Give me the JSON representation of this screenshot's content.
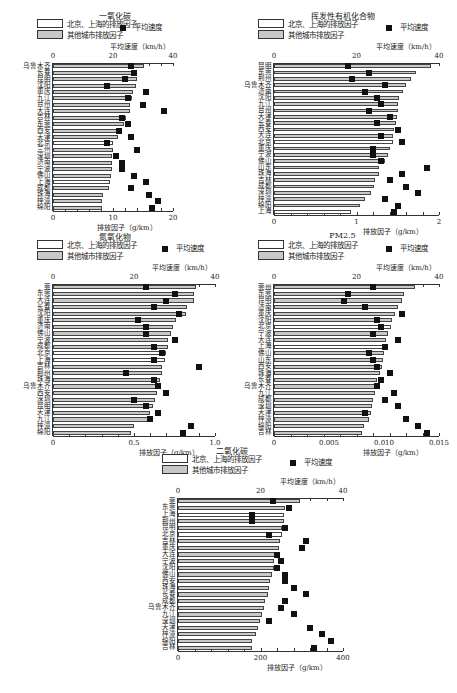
{
  "legend": {
    "bjsh": "北京、上海的排放因子",
    "other": "其他城市排放因子",
    "speed": "平均速度",
    "speed_axis": "平均速度（km/h）",
    "factor_axis": "排放因子（g/km）"
  },
  "chart_data": [
    {
      "type": "bar",
      "title": "一氧化碳",
      "xlabel": "排放因子（g/km）",
      "x2label": "平均速度（km/h）",
      "xlim": [
        0,
        20
      ],
      "x2lim": [
        0,
        40
      ],
      "xticks": [
        "0",
        "10",
        "20"
      ],
      "x2ticks": [
        "0",
        "20",
        "40"
      ],
      "categories": [
        "乌鲁木齐",
        "长春",
        "昆明",
        "沈阳",
        "重庆",
        "九江",
        "台州",
        "大连",
        "吉林",
        "东莞",
        "西安",
        "天津",
        "北京",
        "兰州",
        "深圳",
        "济南",
        "宁波",
        "佛山",
        "上海",
        "成都",
        "珠海",
        "梓潼",
        "绵阳"
      ],
      "highlight": [
        "北京",
        "上海"
      ],
      "factor": [
        15.2,
        14.0,
        14.0,
        13.8,
        13.3,
        13.1,
        12.9,
        12.8,
        12.2,
        11.8,
        11.2,
        10.9,
        10.0,
        10.0,
        9.9,
        9.9,
        9.8,
        9.7,
        9.5,
        9.3,
        8.3,
        8.2,
        8.1
      ],
      "speed": [
        26,
        27,
        24,
        18,
        31,
        25,
        30,
        37,
        23,
        25,
        22,
        26,
        18,
        28,
        21,
        23,
        23,
        27,
        31,
        26,
        32,
        35,
        33
      ]
    },
    {
      "type": "bar",
      "title": "挥发性有机化合物",
      "xlabel": "排放因子（g/km）",
      "x2label": "平均速度（km/h）",
      "xlim": [
        0,
        2
      ],
      "x2lim": [
        0,
        40
      ],
      "xticks": [
        "0",
        "1",
        "2"
      ],
      "x2ticks": [
        "0",
        "20",
        "40"
      ],
      "categories": [
        "昆明",
        "东莞",
        "荆州",
        "乌鲁木齐",
        "济南",
        "沈阳",
        "九江",
        "台州",
        "天津",
        "长春",
        "西安",
        "大连",
        "北京",
        "重庆",
        "宁波",
        "佛山",
        "山东",
        "珠海",
        "吉林",
        "成都",
        "深圳",
        "梓潼",
        "绵阳",
        "上海"
      ],
      "highlight": [
        "北京",
        "上海"
      ],
      "factor": [
        1.9,
        1.72,
        1.66,
        1.6,
        1.56,
        1.52,
        1.5,
        1.5,
        1.49,
        1.48,
        1.46,
        1.44,
        1.44,
        1.4,
        1.38,
        1.35,
        1.27,
        1.27,
        1.22,
        1.21,
        1.18,
        1.1,
        1.04,
        0.93
      ],
      "speed": [
        18,
        23,
        19,
        27,
        22,
        25,
        26,
        23,
        28,
        25,
        30,
        26,
        31,
        24,
        24,
        26,
        37,
        31,
        28,
        32,
        35,
        27,
        30,
        29
      ]
    },
    {
      "type": "bar",
      "title": "氮氧化物",
      "xlabel": "排放因子（g/km）",
      "x2label": "平均速度（km/h）",
      "xlim": [
        0,
        1.0
      ],
      "x2lim": [
        0,
        40
      ],
      "xticks": [
        "0",
        "0.5",
        "1.0"
      ],
      "x2ticks": [
        "0",
        "20",
        "40"
      ],
      "categories": [
        "莞",
        "东莞",
        "大连",
        "长春",
        "沈阳",
        "重庆",
        "济南",
        "佛山",
        "宁波",
        "成都",
        "北京",
        "上海",
        "吉林",
        "荆州",
        "珠海",
        "乌鲁木齐",
        "西安",
        "深圳",
        "昆明",
        "天津",
        "九江",
        "梓潼",
        "绵阳"
      ],
      "highlight": [
        "北京",
        "上海"
      ],
      "factor": [
        0.88,
        0.87,
        0.87,
        0.83,
        0.82,
        0.76,
        0.74,
        0.73,
        0.71,
        0.71,
        0.7,
        0.69,
        0.67,
        0.67,
        0.66,
        0.64,
        0.64,
        0.63,
        0.62,
        0.6,
        0.59,
        0.5,
        0.48
      ],
      "speed": [
        23,
        30,
        28,
        25,
        31,
        21,
        23,
        23,
        30,
        25,
        27,
        25,
        36,
        18,
        25,
        26,
        28,
        20,
        23,
        26,
        24,
        34,
        32
      ]
    },
    {
      "type": "bar",
      "title": "PM2.5",
      "xlabel": "排放因子（g/km）",
      "x2label": "平均速度（km/h）",
      "xlim": [
        0,
        0.015
      ],
      "x2lim": [
        0,
        40
      ],
      "xticks": [
        "0",
        "0.005",
        "0.010",
        "0.015"
      ],
      "x2ticks": [
        "0",
        "20",
        "40"
      ],
      "categories": [
        "莞州",
        "东莞",
        "昆明",
        "济南",
        "重庆",
        "沈阳",
        "北京",
        "宁波",
        "大连",
        "上海",
        "佛山",
        "山东",
        "西安",
        "珠海",
        "长春",
        "乌鲁木齐",
        "九江",
        "成都",
        "深圳",
        "天津",
        "梓潼",
        "绵阳",
        "吉林"
      ],
      "highlight": [
        "北京",
        "上海"
      ],
      "factor": [
        0.0128,
        0.0118,
        0.0116,
        0.0113,
        0.011,
        0.0107,
        0.0106,
        0.0104,
        0.0102,
        0.0102,
        0.01,
        0.0099,
        0.0098,
        0.0096,
        0.0094,
        0.0093,
        0.0092,
        0.009,
        0.0089,
        0.0088,
        0.0086,
        0.0082,
        0.008
      ],
      "speed": [
        24,
        18,
        17,
        22,
        31,
        25,
        26,
        24,
        30,
        27,
        23,
        24,
        25,
        28,
        26,
        25,
        29,
        27,
        30,
        22,
        32,
        35,
        37
      ]
    },
    {
      "type": "bar",
      "title": "二氧化碳",
      "xlabel": "排放因子（g/km）",
      "x2label": "平均速度（km/h）",
      "xlim": [
        0,
        400
      ],
      "x2lim": [
        0,
        40
      ],
      "xticks": [
        "0",
        "200",
        "400"
      ],
      "x2ticks": [
        "0",
        "20",
        "40"
      ],
      "categories": [
        "莞",
        "东莞",
        "上海",
        "荆州",
        "昆明",
        "北京",
        "吉林",
        "重庆",
        "大连",
        "宁波",
        "沈阳",
        "佛山",
        "西安",
        "珠海",
        "长春",
        "成都",
        "乌鲁木齐",
        "九江",
        "深圳",
        "天津",
        "梓潼",
        "绵阳",
        "吉林"
      ],
      "highlight": [
        "北京",
        "上海"
      ],
      "factor": [
        296,
        260,
        258,
        256,
        253,
        253,
        248,
        245,
        236,
        233,
        232,
        228,
        222,
        220,
        218,
        210,
        208,
        204,
        198,
        193,
        190,
        180,
        180
      ],
      "speed": [
        23,
        27,
        18,
        18,
        26,
        22,
        31,
        30,
        24,
        25,
        24,
        26,
        26,
        28,
        31,
        26,
        25,
        28,
        22,
        32,
        35,
        37,
        33
      ]
    }
  ]
}
